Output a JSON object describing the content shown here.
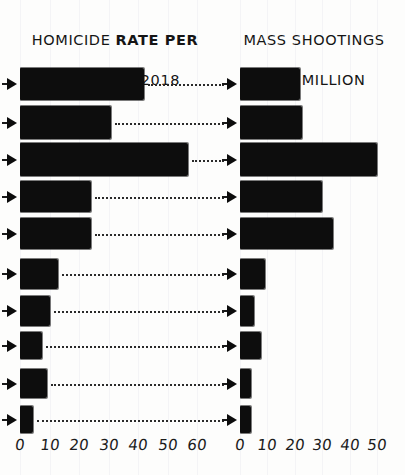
{
  "panels": {
    "left": {
      "title_line1": "HOMICIDE RATE PER",
      "title_line2": "100,000 IN 2018",
      "axis_ticks": [
        "0",
        "10",
        "20",
        "30",
        "40",
        "50",
        "60"
      ]
    },
    "right": {
      "title_line1": "MASS SHOOTINGS",
      "title_line2": "PER MILLION",
      "axis_ticks": [
        "0",
        "10",
        "20",
        "30",
        "40",
        "50"
      ]
    }
  },
  "icons": {
    "row_marker": "right-triangle-arrow-icon",
    "connector": "dotted-leader-line"
  },
  "style": {
    "ink": "#0b0b0b",
    "paper": "#fdfdfc",
    "gridline": "#eeeef1"
  },
  "chart_data": [
    {
      "type": "bar",
      "orientation": "horizontal",
      "title": "HOMICIDE RATE PER 100,000 IN 2018",
      "xlabel": "",
      "ylabel": "",
      "xlim": [
        0,
        62
      ],
      "grid": true,
      "legend": "none",
      "tick_values": [
        0,
        10,
        20,
        30,
        40,
        50,
        60
      ],
      "categories": [
        "row-1",
        "row-2",
        "row-3",
        "row-4",
        "row-5",
        "row-6",
        "row-7",
        "row-8",
        "row-9",
        "row-10"
      ],
      "values": [
        42,
        31,
        57,
        24,
        24,
        13,
        10,
        7.5,
        9,
        4.5
      ]
    },
    {
      "type": "bar",
      "orientation": "horizontal",
      "title": "MASS SHOOTINGS PER MILLION",
      "xlabel": "",
      "ylabel": "",
      "xlim": [
        0,
        52
      ],
      "grid": true,
      "legend": "none",
      "tick_values": [
        0,
        10,
        20,
        30,
        40,
        50
      ],
      "categories": [
        "row-1",
        "row-2",
        "row-3",
        "row-4",
        "row-5",
        "row-6",
        "row-7",
        "row-8",
        "row-9",
        "row-10"
      ],
      "values": [
        22,
        22.5,
        50,
        30,
        34,
        9,
        5,
        7.5,
        4,
        4
      ]
    }
  ]
}
